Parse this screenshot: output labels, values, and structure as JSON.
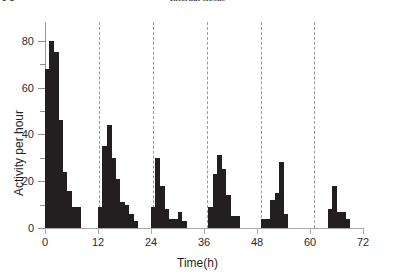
{
  "header": {
    "page_number": "5 8",
    "running_title": "Internal clocks"
  },
  "chart_data": {
    "type": "bar",
    "title": "",
    "xlabel": "Time(h)",
    "ylabel": "Activity per hour",
    "xlim": [
      0,
      72
    ],
    "ylim": [
      0,
      88
    ],
    "xticks": [
      0,
      12,
      24,
      36,
      48,
      60,
      72
    ],
    "yticks": [
      0,
      20,
      40,
      60,
      80
    ],
    "xtick_labels": [
      "0",
      "12",
      "24",
      "36",
      "48",
      "60",
      "72"
    ],
    "ytick_labels": [
      "0",
      "20",
      "40",
      "60",
      "80"
    ],
    "y_minor_ticks": [
      10,
      30,
      50,
      70
    ],
    "grid": false,
    "legend": null,
    "bar_width_hours": 1,
    "annotations": {
      "dashed_vertical_lines_hours": [
        0,
        12.2,
        24.4,
        36.6,
        48.8,
        61.0
      ],
      "dashed_line_color": "#9a9a9a",
      "description": "Dashed vertical lines mark successive subjective-day onsets, drifting later each cycle (free-running period slightly longer than 24 h)."
    },
    "bar_color": "#231f20",
    "x": [
      0,
      1,
      2,
      3,
      4,
      5,
      6,
      7,
      12,
      13,
      14,
      15,
      16,
      17,
      18,
      19,
      20,
      24,
      25,
      26,
      27,
      28,
      29,
      30,
      31,
      37,
      38,
      39,
      40,
      41,
      42,
      43,
      49,
      50,
      51,
      52,
      53,
      54,
      61,
      62,
      63,
      64,
      65,
      66,
      67,
      68
    ],
    "values": [
      68,
      80,
      75,
      46,
      24,
      16,
      9,
      9,
      9,
      35,
      44,
      30,
      21,
      11,
      10,
      6,
      3,
      9,
      30,
      18,
      8,
      4,
      4,
      7,
      3,
      9,
      23,
      31,
      25,
      14,
      5,
      5,
      4,
      4,
      12,
      15,
      28,
      6,
      0,
      0,
      0,
      8,
      18,
      7,
      7,
      4
    ],
    "bursts": [
      {
        "name": "day-1",
        "onset_hour": 0,
        "peak_value": 80
      },
      {
        "name": "day-2",
        "onset_hour": 12.2,
        "peak_value": 44
      },
      {
        "name": "day-3",
        "onset_hour": 24.4,
        "peak_value": 30
      },
      {
        "name": "day-4",
        "onset_hour": 36.6,
        "peak_value": 31
      },
      {
        "name": "day-5",
        "onset_hour": 48.8,
        "peak_value": 28
      },
      {
        "name": "day-6",
        "onset_hour": 61.0,
        "peak_value": 18
      }
    ]
  }
}
